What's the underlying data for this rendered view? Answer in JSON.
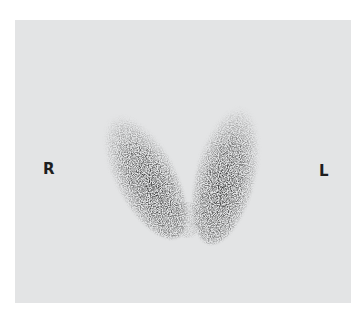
{
  "image": {
    "description": "Thyroid scintigraphy scan, anterior view, showing two elongated lobes in a V shape",
    "background_color": "#e3e4e5",
    "uptake_color": "#2a2a2a"
  },
  "labels": {
    "right": "R",
    "left": "L"
  },
  "lobes": [
    {
      "name": "right-lobe",
      "cx": 143,
      "cy": 172,
      "rx": 28,
      "ry": 70,
      "rotate": -28
    },
    {
      "name": "left-lobe",
      "cx": 229,
      "cy": 172,
      "rx": 28,
      "ry": 70,
      "rotate": 14
    }
  ]
}
